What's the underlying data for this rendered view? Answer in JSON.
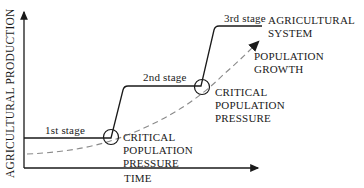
{
  "diagram": {
    "axes": {
      "y_label": "AGRICULTURAL PRODUCTION",
      "x_label": "TIME"
    },
    "stages": [
      {
        "label": "1st stage"
      },
      {
        "label": "2nd stage"
      },
      {
        "label": "3rd stage"
      }
    ],
    "annotations": {
      "critical_1_line1": "CRITICAL",
      "critical_1_line2": "POPULATION",
      "critical_1_line3": "PRESSURE",
      "critical_2_line1": "CRITICAL",
      "critical_2_line2": "POPULATION",
      "critical_2_line3": "PRESSURE",
      "system_line1": "AGRICULTURAL",
      "system_line2": "SYSTEM",
      "growth_line1": "POPULATION",
      "growth_line2": "GROWTH"
    },
    "colors": {
      "line": "#1a1a1a",
      "dashed": "#8a8a8a"
    }
  }
}
